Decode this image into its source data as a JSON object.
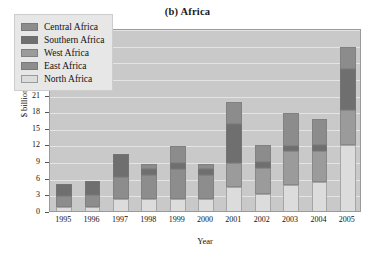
{
  "chart_data": {
    "type": "bar",
    "subtype": "stacked-bar",
    "title": "(b) Africa",
    "xlabel": "Year",
    "ylabel": "$ billion",
    "ylim": [
      0,
      33
    ],
    "ytick_step": 3,
    "yticks": [
      "0",
      "3",
      "6",
      "9",
      "12",
      "15",
      "18",
      "21",
      "24",
      "27",
      "30",
      "33"
    ],
    "grid": true,
    "legend_position": "top-left",
    "categories": [
      "1995",
      "1996",
      "1997",
      "1998",
      "1999",
      "2000",
      "2001",
      "2002",
      "2003",
      "2004",
      "2005"
    ],
    "series": [
      {
        "name": "North Africa",
        "color": "#dcdcdc",
        "values": [
          1.0,
          1.0,
          2.5,
          2.6,
          2.6,
          2.6,
          4.6,
          3.5,
          5.0,
          5.6,
          12.3
        ]
      },
      {
        "name": "East Africa",
        "color": "#8d8d8d",
        "values": [
          2.1,
          2.3,
          4.0,
          4.3,
          5.3,
          4.3,
          0.0,
          0.0,
          0.0,
          0.0,
          0.0
        ]
      },
      {
        "name": "West Africa",
        "color": "#9b9b9b",
        "values": [
          0.0,
          0.0,
          0.0,
          0.0,
          0.0,
          0.0,
          4.4,
          4.6,
          6.1,
          5.5,
          6.2
        ]
      },
      {
        "name": "Southern Africa",
        "color": "#6f6f6f",
        "values": [
          2.1,
          2.4,
          4.2,
          1.0,
          1.1,
          1.1,
          7.1,
          1.1,
          1.0,
          1.1,
          7.5
        ]
      },
      {
        "name": "Central Africa",
        "color": "#8c8c8c",
        "values": [
          0.0,
          0.0,
          0.0,
          1.0,
          3.0,
          0.9,
          3.9,
          3.1,
          5.9,
          4.8,
          4.0
        ]
      }
    ],
    "totals": [
      5.2,
      5.7,
      10.7,
      8.9,
      12.0,
      8.9,
      20.0,
      12.3,
      18.0,
      17.0,
      30.0
    ]
  },
  "legend": {
    "entries": [
      {
        "label": "Central Africa",
        "color": "#8c8c8c"
      },
      {
        "label": "Southern Africa",
        "color": "#6f6f6f"
      },
      {
        "label": "West Africa",
        "color": "#9b9b9b"
      },
      {
        "label": "East Africa",
        "color": "#8d8d8d"
      },
      {
        "label": "North Africa",
        "color": "#dcdcdc"
      }
    ]
  },
  "colors": {
    "plot_background": "#c9c9c9",
    "gridline": "#e4e4e4",
    "legend_background": "#e7e7e7",
    "page_background": "#ffffff",
    "text": "#111111"
  }
}
